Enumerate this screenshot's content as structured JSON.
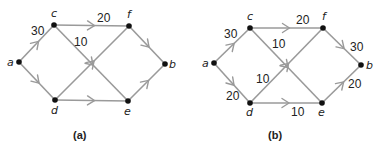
{
  "colors": {
    "edge": "#9a9a9a",
    "node": "#111111",
    "text": "#222222",
    "background": "#ffffff"
  },
  "graphs": [
    {
      "id": "a",
      "caption": "(a)",
      "caption_pos": [
        73,
        139
      ],
      "nodes": [
        {
          "id": "a",
          "label": "a",
          "x": 19,
          "y": 62,
          "lx": 7,
          "ly": 66
        },
        {
          "id": "c",
          "label": "c",
          "x": 54,
          "y": 25,
          "lx": 51,
          "ly": 17
        },
        {
          "id": "f",
          "label": "f",
          "x": 129,
          "y": 26,
          "lx": 127,
          "ly": 18
        },
        {
          "id": "b",
          "label": "b",
          "x": 165,
          "y": 64,
          "lx": 169,
          "ly": 68
        },
        {
          "id": "d",
          "label": "d",
          "x": 55,
          "y": 100,
          "lx": 51,
          "ly": 114
        },
        {
          "id": "e",
          "label": "e",
          "x": 128,
          "y": 101,
          "lx": 124,
          "ly": 115
        }
      ],
      "edges": [
        {
          "from": "a",
          "to": "c",
          "weight": "30",
          "wx": 31,
          "wy": 35
        },
        {
          "from": "a",
          "to": "d",
          "weight": "",
          "wx": 0,
          "wy": 0
        },
        {
          "from": "c",
          "to": "f",
          "weight": "20",
          "wx": 97,
          "wy": 22
        },
        {
          "from": "c",
          "to": "e",
          "weight": "10",
          "wx": 74,
          "wy": 46
        },
        {
          "from": "d",
          "to": "f",
          "weight": "",
          "wx": 0,
          "wy": 0
        },
        {
          "from": "d",
          "to": "e",
          "weight": "",
          "wx": 0,
          "wy": 0
        },
        {
          "from": "f",
          "to": "b",
          "weight": "",
          "wx": 0,
          "wy": 0
        },
        {
          "from": "e",
          "to": "b",
          "weight": "",
          "wx": 0,
          "wy": 0
        }
      ]
    },
    {
      "id": "b",
      "caption": "(b)",
      "caption_pos": [
        268,
        139
      ],
      "nodes": [
        {
          "id": "a",
          "label": "a",
          "x": 214,
          "y": 63,
          "lx": 202,
          "ly": 67
        },
        {
          "id": "c",
          "label": "c",
          "x": 250,
          "y": 28,
          "lx": 247,
          "ly": 20
        },
        {
          "id": "f",
          "label": "f",
          "x": 323,
          "y": 28,
          "lx": 322,
          "ly": 20
        },
        {
          "id": "b",
          "label": "b",
          "x": 361,
          "y": 65,
          "lx": 366,
          "ly": 69
        },
        {
          "id": "d",
          "label": "d",
          "x": 250,
          "y": 103,
          "lx": 246,
          "ly": 116
        },
        {
          "id": "e",
          "label": "e",
          "x": 322,
          "y": 103,
          "lx": 318,
          "ly": 116
        }
      ],
      "edges": [
        {
          "from": "a",
          "to": "c",
          "weight": "30",
          "wx": 224,
          "wy": 38
        },
        {
          "from": "a",
          "to": "d",
          "weight": "20",
          "wx": 226,
          "wy": 100
        },
        {
          "from": "c",
          "to": "f",
          "weight": "20",
          "wx": 296,
          "wy": 24
        },
        {
          "from": "c",
          "to": "e",
          "weight": "10",
          "wx": 272,
          "wy": 48
        },
        {
          "from": "d",
          "to": "f",
          "weight": "10",
          "wx": 256,
          "wy": 83
        },
        {
          "from": "d",
          "to": "e",
          "weight": "10",
          "wx": 291,
          "wy": 116
        },
        {
          "from": "f",
          "to": "b",
          "weight": "30",
          "wx": 350,
          "wy": 51
        },
        {
          "from": "e",
          "to": "b",
          "weight": "20",
          "wx": 348,
          "wy": 88
        }
      ]
    }
  ]
}
